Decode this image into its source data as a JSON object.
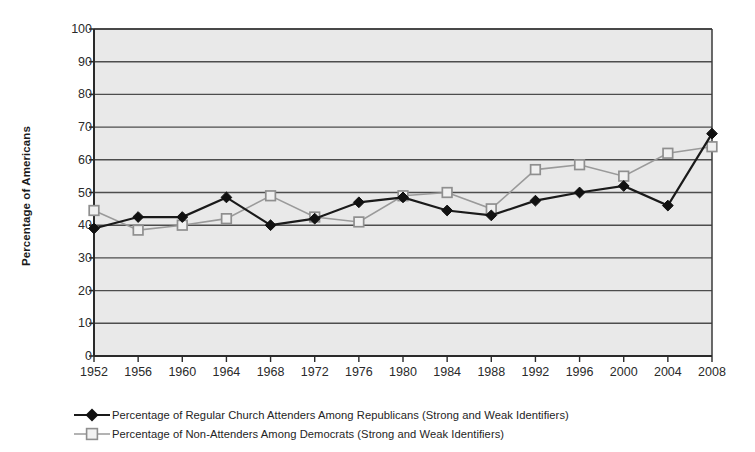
{
  "chart_data": {
    "type": "line",
    "title": "",
    "xlabel": "",
    "ylabel": "Percentage of Americans",
    "categories": [
      "1952",
      "1956",
      "1960",
      "1964",
      "1968",
      "1972",
      "1976",
      "1980",
      "1984",
      "1988",
      "1992",
      "1996",
      "2000",
      "2004",
      "2008"
    ],
    "xtick_labels": [
      "1952",
      "1956",
      "1960",
      "1964",
      "1968",
      "1972",
      "1976",
      "1980",
      "1984",
      "1988",
      "1992",
      "1996",
      "2000",
      "2004",
      "2008"
    ],
    "ytick_labels": [
      "0",
      "10",
      "20",
      "30",
      "40",
      "50",
      "60",
      "70",
      "80",
      "90",
      "100"
    ],
    "ylim": [
      0,
      100
    ],
    "ytick_step": 10,
    "grid": true,
    "grid_axis": "y",
    "legend_position": "below-left",
    "plot_background": "#e9e9e9",
    "grid_color": "#4d4d4d",
    "series": [
      {
        "name": "Percentage of Regular Church Attenders Among Republicans (Strong and Weak Identifiers)",
        "marker": "filled-diamond",
        "color": "#1a1a1a",
        "values": [
          39,
          42.5,
          42.5,
          48.5,
          40,
          42,
          47,
          48.5,
          44.5,
          43,
          47.5,
          50,
          52,
          46,
          68
        ]
      },
      {
        "name": "Percentage of Non-Attenders Among Democrats (Strong and Weak Identifiers)",
        "marker": "open-square",
        "color": "#9a9a9a",
        "values": [
          44.5,
          38.5,
          40,
          42,
          49,
          42.5,
          41,
          49,
          50,
          45,
          57,
          58.5,
          55,
          62,
          64
        ]
      }
    ]
  },
  "legend": {
    "items": [
      {
        "label": "Percentage of Regular Church Attenders Among Republicans (Strong and Weak Identifiers)",
        "marker": "filled-diamond-marker"
      },
      {
        "label": "Percentage of Non-Attenders Among Democrats (Strong and Weak Identifiers)",
        "marker": "open-square-marker"
      }
    ]
  }
}
